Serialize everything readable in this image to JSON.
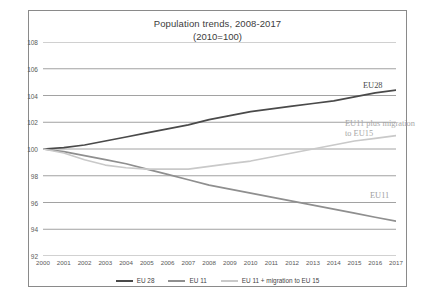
{
  "chart_data": {
    "type": "line",
    "title": "Population trends, 2008-2017",
    "subtitle": "(2010=100)",
    "xlabel": "",
    "ylabel": "",
    "ylim": [
      92,
      108
    ],
    "yticks": [
      92,
      94,
      96,
      98,
      100,
      102,
      104,
      106,
      108
    ],
    "grid": true,
    "legend_position": "bottom",
    "categories": [
      "2000",
      "2001",
      "2002",
      "2003",
      "2004",
      "2005",
      "2006",
      "2007",
      "2008",
      "2009",
      "2010",
      "2011",
      "2012",
      "2013",
      "2014",
      "2015",
      "2016",
      "2017"
    ],
    "series": [
      {
        "name": "EU 28",
        "color": "#4a4a4a",
        "values": [
          100.0,
          100.1,
          100.3,
          100.6,
          100.9,
          101.2,
          101.5,
          101.8,
          102.2,
          102.5,
          102.8,
          103.0,
          103.2,
          103.4,
          103.6,
          103.9,
          104.2,
          104.4
        ]
      },
      {
        "name": "EU 11",
        "color": "#8f8f8f",
        "values": [
          100.0,
          99.8,
          99.5,
          99.2,
          98.9,
          98.5,
          98.1,
          97.7,
          97.3,
          97.0,
          96.7,
          96.4,
          96.1,
          95.8,
          95.5,
          95.2,
          94.9,
          94.6
        ]
      },
      {
        "name": "EU 11 + migration to EU 15",
        "color": "#c9c9c9",
        "values": [
          100.0,
          99.7,
          99.2,
          98.8,
          98.6,
          98.5,
          98.5,
          98.5,
          98.7,
          98.9,
          99.1,
          99.4,
          99.7,
          100.0,
          100.3,
          100.6,
          100.8,
          101.0
        ]
      }
    ],
    "annotations": [
      {
        "name": "eu28-label",
        "text": "EU28"
      },
      {
        "name": "migration-label-line1",
        "text": "EU11 plus migration"
      },
      {
        "name": "migration-label-line2",
        "text": "to EU15"
      },
      {
        "name": "eu11-label",
        "text": "EU11"
      }
    ]
  }
}
